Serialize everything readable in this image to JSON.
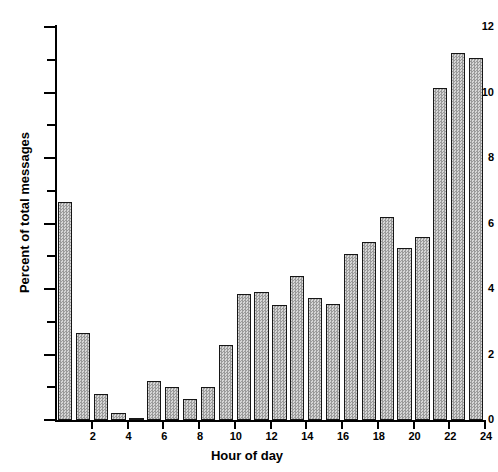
{
  "chart_data": {
    "type": "bar",
    "title": "",
    "xlabel": "Hour of day",
    "ylabel": "Percent of total messages",
    "categories": [
      1,
      2,
      3,
      4,
      5,
      6,
      7,
      8,
      9,
      10,
      11,
      12,
      13,
      14,
      15,
      16,
      17,
      18,
      19,
      20,
      21,
      22,
      23,
      24
    ],
    "values": [
      6.65,
      2.65,
      0.78,
      0.2,
      0.05,
      1.2,
      1.0,
      0.65,
      1.0,
      2.3,
      3.85,
      3.92,
      3.5,
      4.4,
      3.72,
      3.55,
      5.08,
      5.45,
      6.2,
      5.25,
      5.6,
      10.15,
      11.2,
      11.05
    ],
    "xlim": [
      0,
      24
    ],
    "ylim": [
      0,
      12
    ],
    "y_major_ticks": [
      0,
      2,
      4,
      6,
      8,
      10,
      12
    ],
    "y_minor_ticks": [
      1,
      3,
      5,
      7,
      9,
      11
    ],
    "y_tick_labels": [
      "0",
      "2",
      "4",
      "6",
      "8",
      "10",
      "12"
    ],
    "x_major_ticks": [
      2,
      4,
      6,
      8,
      10,
      12,
      14,
      16,
      18,
      20,
      22,
      24
    ],
    "x_tick_labels": [
      "2",
      "4",
      "6",
      "8",
      "10",
      "12",
      "14",
      "16",
      "18",
      "20",
      "22",
      "24"
    ],
    "grid": false,
    "legend": null,
    "bar_fill_color": "#b0b0b0",
    "bar_edge_color": "#161616",
    "background_color": "#ffffff"
  }
}
